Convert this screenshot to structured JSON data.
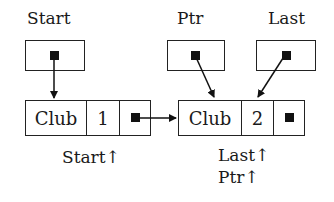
{
  "pointer_vars": [
    {
      "name": "Start"
    },
    {
      "name": "Ptr"
    },
    {
      "name": "Last"
    }
  ],
  "nodes": [
    {
      "field1": "Club",
      "field2": "1",
      "caption_lines": [
        "Start↑"
      ]
    },
    {
      "field1": "Club",
      "field2": "2",
      "caption_lines": [
        "Last↑",
        "Ptr↑"
      ]
    }
  ],
  "colors": {
    "line": "#222222",
    "background": "#ffffff"
  }
}
